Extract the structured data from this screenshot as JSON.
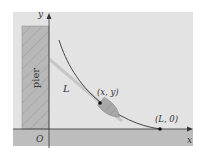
{
  "diagram": {
    "pier_label": "pier",
    "tangent_label": "L",
    "point_label": "(x, y)",
    "endpoint_label": "(L, 0)",
    "origin_label": "O",
    "x_axis_label": "x",
    "y_axis_label": "y"
  },
  "colors": {
    "panel": "#e3e3e3",
    "ground": "#bdbdbd",
    "pier_fill": "#b5b5b5",
    "curve": "#333333",
    "tangent": "#c4c4c4",
    "boat": "#a8a8a8"
  }
}
